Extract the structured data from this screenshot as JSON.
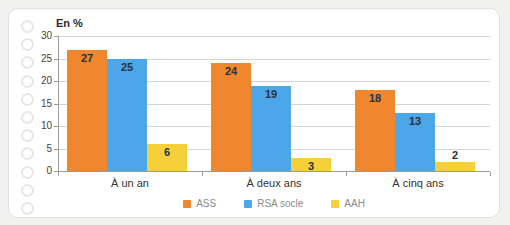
{
  "page": {
    "background": "#f1f1ef",
    "card_background": "#ffffff"
  },
  "chart_data": {
    "type": "bar",
    "title": "",
    "ylabel": "En %",
    "categories": [
      "À un an",
      "À deux ans",
      "À cinq ans"
    ],
    "series": [
      {
        "name": "ASS",
        "color": "#F0862E",
        "values": [
          27,
          24,
          18
        ]
      },
      {
        "name": "RSA socle",
        "color": "#4BA7E8",
        "values": [
          25,
          19,
          13
        ]
      },
      {
        "name": "AAH",
        "color": "#F5D03A",
        "values": [
          6,
          3,
          2
        ]
      }
    ],
    "ylim": [
      0,
      30
    ],
    "yticks": [
      0,
      5,
      10,
      15,
      20,
      25,
      30
    ],
    "grid": true,
    "legend_position": "bottom"
  }
}
